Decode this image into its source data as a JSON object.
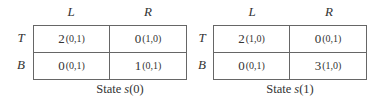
{
  "games": [
    {
      "col_labels": [
        "L",
        "R"
      ],
      "row_labels": [
        "T",
        "B"
      ],
      "cells": [
        [
          {
            "value": "2",
            "sub": "(0,1)"
          },
          {
            "value": "0",
            "sub": "(1,0)"
          }
        ],
        [
          {
            "value": "0",
            "sub": "(0,1)"
          },
          {
            "value": "1",
            "sub": "(0,1)"
          }
        ]
      ],
      "caption_prefix": "State ",
      "caption_var": "s",
      "caption_arg": "(0)"
    },
    {
      "col_labels": [
        "L",
        "R"
      ],
      "row_labels": [
        "T",
        "B"
      ],
      "cells": [
        [
          {
            "value": "2",
            "sub": "(1,0)"
          },
          {
            "value": "0",
            "sub": "(0,1)"
          }
        ],
        [
          {
            "value": "0",
            "sub": "(0,1)"
          },
          {
            "value": "3",
            "sub": "(1,0)"
          }
        ]
      ],
      "caption_prefix": "State ",
      "caption_var": "s",
      "caption_arg": "(1)"
    }
  ]
}
